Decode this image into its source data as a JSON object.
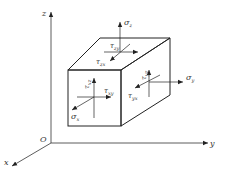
{
  "axes": {
    "origin": "O",
    "x": "x",
    "y": "y",
    "z": "z"
  },
  "stresses": {
    "top_face": {
      "normal": {
        "symbol": "σ",
        "sub": "z"
      },
      "shear1": {
        "symbol": "τ",
        "sub": "zx"
      },
      "shear2": {
        "symbol": "τ",
        "sub": "zy"
      }
    },
    "front_face": {
      "normal": {
        "symbol": "σ",
        "sub": "x"
      },
      "shear1": {
        "symbol": "τ",
        "sub": "xz"
      },
      "shear2": {
        "symbol": "τ",
        "sub": "xy"
      }
    },
    "right_face": {
      "normal": {
        "symbol": "σ",
        "sub": "y"
      },
      "shear1": {
        "symbol": "τ",
        "sub": "yz"
      },
      "shear2": {
        "symbol": "τ",
        "sub": "yx"
      }
    }
  },
  "colors": {
    "line": "#222222",
    "text": "#333333",
    "background": "#ffffff"
  }
}
